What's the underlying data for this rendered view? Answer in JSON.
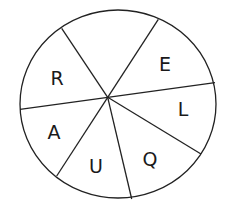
{
  "diagram": {
    "type": "sector-wheel",
    "stroke_color": "#222222",
    "sectors": [
      {
        "position": "top",
        "label": ""
      },
      {
        "position": "upper-right",
        "label": "E"
      },
      {
        "position": "right",
        "label": "L"
      },
      {
        "position": "lower-right",
        "label": "Q"
      },
      {
        "position": "bottom",
        "label": "U"
      },
      {
        "position": "left",
        "label": "A"
      },
      {
        "position": "upper-left",
        "label": "R"
      }
    ]
  }
}
